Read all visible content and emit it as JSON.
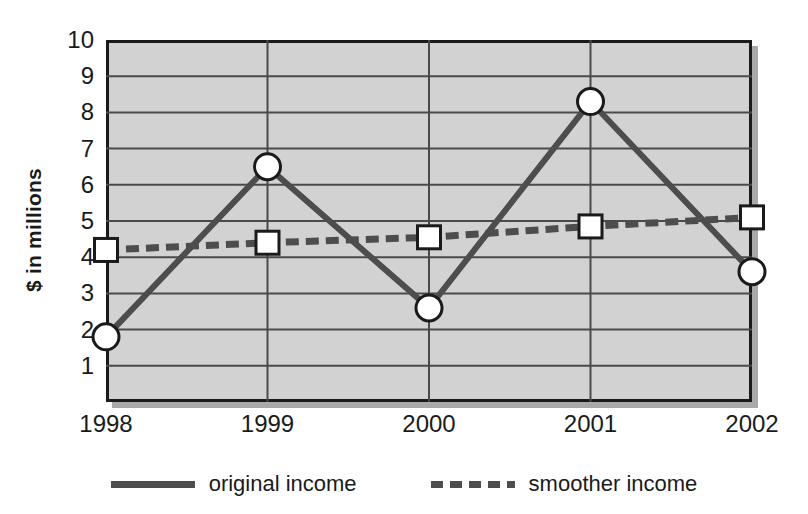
{
  "chart_data": {
    "type": "line",
    "title": "",
    "xlabel": "",
    "ylabel": "$ in millions",
    "categories": [
      "1998",
      "1999",
      "2000",
      "2001",
      "2002"
    ],
    "xticklabels": [
      "1998",
      "1999",
      "2000",
      "2001",
      "2002"
    ],
    "yticklabels": [
      "1",
      "2",
      "3",
      "4",
      "5",
      "6",
      "7",
      "8",
      "9",
      "10"
    ],
    "ylim": [
      0,
      10
    ],
    "ytick_values": [
      1,
      2,
      3,
      4,
      5,
      6,
      7,
      8,
      9,
      10
    ],
    "grid": true,
    "grid_axis": "both",
    "legend_position": "bottom",
    "series": [
      {
        "name": "original income",
        "label": "original income",
        "linestyle": "solid",
        "marker": "circle",
        "color": "#4d4d4d",
        "values": [
          1.8,
          6.5,
          2.6,
          8.3,
          3.6
        ]
      },
      {
        "name": "smoother income",
        "label": "smoother income",
        "linestyle": "dashed",
        "marker": "square",
        "color": "#4d4d4d",
        "values": [
          4.2,
          4.4,
          4.55,
          4.85,
          5.1
        ]
      }
    ]
  },
  "style": {
    "plot_background": "#d2d2d2",
    "plot_border": "#1a1a1a",
    "shadow_color": "#a9a9a9",
    "grid_color": "#4a4a4a",
    "line_color": "#4d4d4d",
    "marker_fill": "#ffffff",
    "marker_edge": "#1a1a1a",
    "page_background": "#ffffff",
    "text_color": "#1a1a1a"
  }
}
